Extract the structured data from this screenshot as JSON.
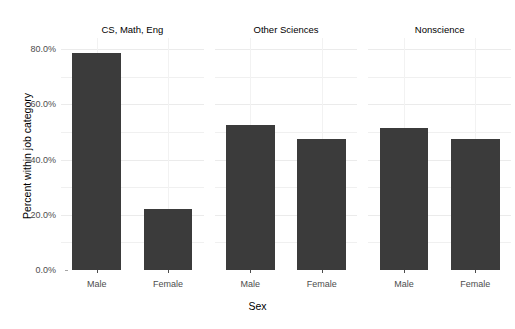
{
  "chart_data": {
    "type": "bar",
    "title": "",
    "xlabel": "Sex",
    "ylabel": "Percent within job category",
    "ylim": [
      0,
      84
    ],
    "grid": true,
    "legend": "none",
    "facet_variable": "Job category",
    "categories": [
      "Male",
      "Female"
    ],
    "yticks": [
      {
        "value": 0,
        "label": "0.0%"
      },
      {
        "value": 20,
        "label": "20.0%"
      },
      {
        "value": 40,
        "label": "40.0%"
      },
      {
        "value": 60,
        "label": "60.0%"
      },
      {
        "value": 80,
        "label": "80.0%"
      }
    ],
    "bar_color": "#3b3b3b",
    "panels": [
      {
        "title": "CS, Math, Eng",
        "bars": [
          {
            "label": "Male",
            "value": 78.5
          },
          {
            "label": "Female",
            "value": 22.2
          }
        ]
      },
      {
        "title": "Other Sciences",
        "bars": [
          {
            "label": "Male",
            "value": 52.5
          },
          {
            "label": "Female",
            "value": 47.5
          }
        ]
      },
      {
        "title": "Nonscience",
        "bars": [
          {
            "label": "Male",
            "value": 51.5
          },
          {
            "label": "Female",
            "value": 47.5
          }
        ]
      }
    ]
  }
}
